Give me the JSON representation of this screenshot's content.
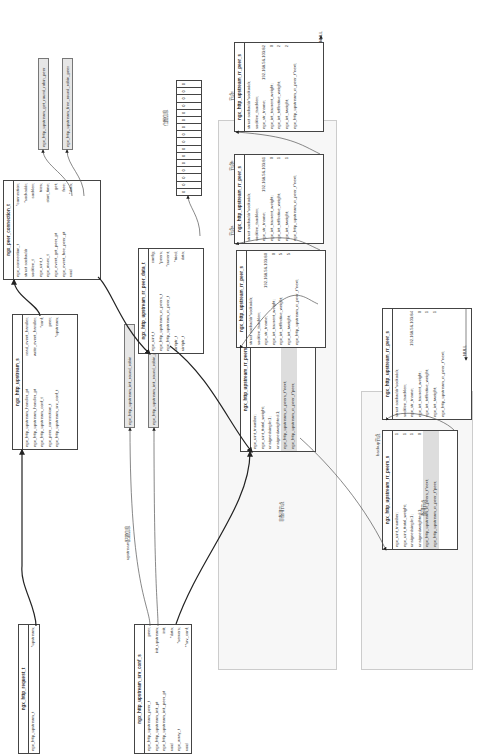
{
  "labels": {
    "upstream_config": "upstream配置信息",
    "primary_nodes": "非备用节点",
    "backup_nodes": "备用节点",
    "backup_title": "backup节点",
    "bitmap_title": "位图信息",
    "node_a": "节点a",
    "node_b": "节点b",
    "node_c": "节点c",
    "null1": "NULL",
    "null2": "NULL"
  },
  "request_t": {
    "title": "ngx_http_request_t",
    "rows": [
      {
        "type": "ngx_http_upstream_t",
        "name": "*upstream;"
      }
    ]
  },
  "upstream_s": {
    "title": "ngx_http_upstream_s",
    "rows": [
      {
        "type": "ngx_http_upstream_handler_pt",
        "name": "read_event_handler;"
      },
      {
        "type": "ngx_http_upstream_handler_pt",
        "name": "write_event_handler;"
      },
      {
        "type": "ngx_http_upstream_conf_t",
        "name": "*conf;"
      },
      {
        "type": "ngx_peer_connection_t",
        "name": "peer;"
      },
      {
        "type": "ngx_http_upstream_srv_conf_t",
        "name": "*upstream;"
      }
    ]
  },
  "peer_connection": {
    "title": "ngx_peer_connection_t",
    "rows": [
      {
        "type": "ngx_connection_t",
        "name": "*connection;"
      },
      {
        "type": "struct sockaddr",
        "name": "*sockaddr;"
      },
      {
        "type": "socklen_t",
        "name": "socklen;"
      },
      {
        "type": "ngx_uint_t",
        "name": "tries;"
      },
      {
        "type": "ngx_msec_t",
        "name": "start_time;"
      },
      {
        "type": "ngx_event_get_peer_pt",
        "name": "get;"
      },
      {
        "type": "ngx_event_free_peer_pt",
        "name": "free;"
      },
      {
        "type": "void",
        "name": "*data;"
      }
    ]
  },
  "functions": {
    "get_peer": "ngx_http_upstream_get_round_robin_peer",
    "free_peer": "ngx_http_upstream_free_round_robin_peer",
    "init_rr": "ngx_http_upstream_init_round_robin",
    "init_rr_peer": "ngx_http_upstream_init_round_robin_peer"
  },
  "srv_conf": {
    "title": "ngx_http_upstream_srv_conf_s",
    "rows": [
      {
        "type": "ngx_http_upstream_peer_t",
        "name": "peer;"
      },
      {
        "type": "ngx_http_upstream_init_pt",
        "name": "init_upstream;"
      },
      {
        "type": "ngx_http_upstream_init_peer_pt",
        "name": "init;"
      },
      {
        "type": "void",
        "name": "*data;"
      },
      {
        "type": "ngx_array_t",
        "name": "*servers;"
      },
      {
        "type": "void",
        "name": "**srv_conf;"
      }
    ]
  },
  "peer_data": {
    "title": "ngx_http_upstream_rr_peer_data_t",
    "rows": [
      {
        "type": "ngx_uint_t",
        "name": "config;"
      },
      {
        "type": "ngx_http_upstream_rr_peers_t",
        "name": "*peers;"
      },
      {
        "type": "ngx_http_upstream_rr_peer_t",
        "name": "*current;"
      },
      {
        "type": "uintptr_t",
        "name": "*tried;"
      },
      {
        "type": "uintptr_t",
        "name": "data;"
      }
    ]
  },
  "bitmap": [
    "0",
    "0",
    "0",
    "0",
    "0",
    "0",
    "0",
    "0",
    "0",
    "0",
    "0",
    "0",
    "0",
    "0",
    "0",
    "0"
  ],
  "peers_primary": {
    "title": "ngx_http_upstream_rr_peers_s",
    "rows": [
      {
        "type": "ngx_uint_t",
        "name": "number;",
        "value": "3"
      },
      {
        "type": "ngx_uint_t",
        "name": "total_weight;",
        "value": "8"
      },
      {
        "type": "unsigned",
        "name": "single:1;",
        "value": "0"
      },
      {
        "type": "unsigned",
        "name": "weighted:1;",
        "value": "1"
      },
      {
        "type": "ngx_http_upstream_rr_peers_t",
        "name": "*next;",
        "value": ""
      },
      {
        "type": "ngx_http_upstream_rr_peer_t",
        "name": "*peer;",
        "value": ""
      }
    ]
  },
  "peers_backup": {
    "title": "ngx_http_upstream_rr_peers_s",
    "rows": [
      {
        "type": "ngx_uint_t",
        "name": "number;",
        "value": "1"
      },
      {
        "type": "ngx_uint_t",
        "name": "total_weight;",
        "value": "1"
      },
      {
        "type": "unsigned",
        "name": "single:1;",
        "value": "1"
      },
      {
        "type": "unsigned",
        "name": "weighted:1;",
        "value": "0"
      },
      {
        "type": "ngx_http_upstream_rr_peers_t",
        "name": "*next;",
        "value": ""
      },
      {
        "type": "ngx_http_upstream_rr_peer_t",
        "name": "*peer;",
        "value": ""
      }
    ]
  },
  "peer_a": {
    "title": "ngx_http_upstream_rr_peer_s",
    "rows": [
      {
        "type": "struct sockaddr",
        "name": "*sockaddr;",
        "value": ""
      },
      {
        "type": "socklen_t",
        "name": "socklen;",
        "value": ""
      },
      {
        "type": "ngx_str_t",
        "name": "name;",
        "value": "192.168.56.103:80"
      },
      {
        "type": "ngx_int_t",
        "name": "current_weight;",
        "value": "0"
      },
      {
        "type": "ngx_int_t",
        "name": "effective_weight;",
        "value": "5"
      },
      {
        "type": "ngx_int_t",
        "name": "weight;",
        "value": "5"
      },
      {
        "type": "ngx_http_upstream_rr_peer_t",
        "name": "*next;",
        "value": ""
      }
    ]
  },
  "peer_b": {
    "title": "ngx_http_upstream_rr_peer_s",
    "rows": [
      {
        "type": "struct sockaddr",
        "name": "*sockaddr;",
        "value": ""
      },
      {
        "type": "socklen_t",
        "name": "socklen;",
        "value": ""
      },
      {
        "type": "ngx_str_t",
        "name": "name;",
        "value": "192.168.56.103:81"
      },
      {
        "type": "ngx_int_t",
        "name": "current_weight;",
        "value": "0"
      },
      {
        "type": "ngx_int_t",
        "name": "effective_weight;",
        "value": "1"
      },
      {
        "type": "ngx_int_t",
        "name": "weight;",
        "value": "1"
      },
      {
        "type": "ngx_http_upstream_rr_peer_t",
        "name": "*next;",
        "value": ""
      }
    ]
  },
  "peer_c": {
    "title": "ngx_http_upstream_rr_peer_s",
    "rows": [
      {
        "type": "struct sockaddr",
        "name": "*sockaddr;",
        "value": ""
      },
      {
        "type": "socklen_t",
        "name": "socklen;",
        "value": ""
      },
      {
        "type": "ngx_str_t",
        "name": "name;",
        "value": "192.168.56.103:82"
      },
      {
        "type": "ngx_int_t",
        "name": "current_weight;",
        "value": "0"
      },
      {
        "type": "ngx_int_t",
        "name": "effective_weight;",
        "value": "2"
      },
      {
        "type": "ngx_int_t",
        "name": "weight;",
        "value": "2"
      },
      {
        "type": "ngx_http_upstream_rr_peer_t",
        "name": "*next;",
        "value": ""
      }
    ]
  },
  "peer_backup": {
    "title": "ngx_http_upstream_rr_peer_s",
    "rows": [
      {
        "type": "struct sockaddr",
        "name": "*sockaddr;",
        "value": ""
      },
      {
        "type": "socklen_t",
        "name": "socklen;",
        "value": ""
      },
      {
        "type": "ngx_str_t",
        "name": "name;",
        "value": "192.168.56.103:84"
      },
      {
        "type": "ngx_int_t",
        "name": "current_weight;",
        "value": "0"
      },
      {
        "type": "ngx_int_t",
        "name": "effective_weight;",
        "value": "1"
      },
      {
        "type": "ngx_int_t",
        "name": "weight;",
        "value": "1"
      },
      {
        "type": "ngx_http_upstream_rr_peer_t",
        "name": "*next;",
        "value": ""
      }
    ]
  }
}
